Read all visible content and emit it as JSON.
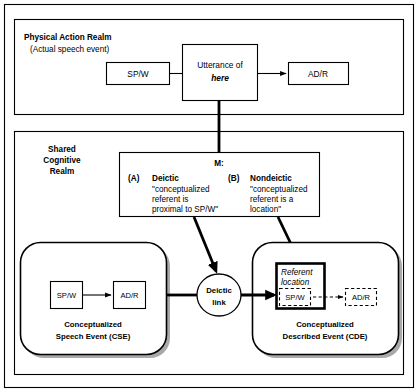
{
  "figure": {
    "title_physical_realm": "Physical Action Realm",
    "subtitle_physical_realm": "(Actual speech event)",
    "title_shared_realm_line1": "Shared",
    "title_shared_realm_line2": "Cognitive",
    "title_shared_realm_line3": "Realm"
  },
  "physical_realm": {
    "speaker_box": "SP/W",
    "utterance_box_line1": "Utterance of",
    "utterance_box_line2": "here",
    "addressee_box": "AD/R"
  },
  "meaning_box": {
    "label": "M:",
    "a_marker": "(A)",
    "a_title": "Deictic",
    "a_line1": "\"conceptualized",
    "a_line2": "referent is",
    "a_line3": "proximal to SP/W\"",
    "b_marker": "(B)",
    "b_title": "Nondeictic",
    "b_line1": "\"conceptualized",
    "b_line2": "referent is a",
    "b_line3": "location\""
  },
  "cse": {
    "speaker_box": "SP/W",
    "addressee_box": "AD/R",
    "caption_line1": "Conceptualized",
    "caption_line2": "Speech Event (CSE)"
  },
  "deictic_link": {
    "line1": "Deictic",
    "line2": "link"
  },
  "cde": {
    "referent_line1": "Referent",
    "referent_line2": "location",
    "speaker_box": "SP/W",
    "addressee_box": "AD/R",
    "caption_line1": "Conceptualized",
    "caption_line2": "Described Event (CDE)"
  },
  "colors": {
    "stroke": "#000000",
    "fill": "#ffffff",
    "shadow": "#9a9a9a"
  }
}
